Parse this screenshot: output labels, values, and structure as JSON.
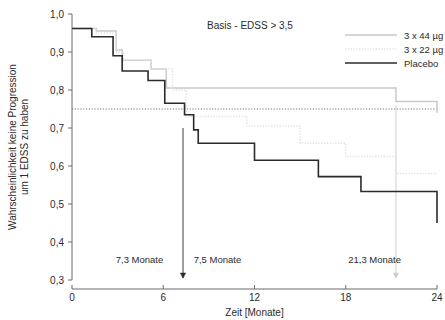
{
  "chart_data": {
    "type": "line",
    "title": "Basis - EDSS > 3,5",
    "xlabel": "Zeit [Monate]",
    "ylabel_line1": "Wahrscheinlichkeit keine Progression",
    "ylabel_line2": "um 1 EDSS zu haben",
    "xlim": [
      0,
      24
    ],
    "ylim": [
      0.3,
      1.0
    ],
    "xticks": [
      0,
      6,
      12,
      18,
      24
    ],
    "xticklabels": [
      "0",
      "6",
      "12",
      "18",
      "24"
    ],
    "yticks": [
      0.3,
      0.4,
      0.5,
      0.6,
      0.7,
      0.8,
      0.9,
      1.0
    ],
    "yticklabels": [
      "0,3",
      "0,4",
      "0,5",
      "0,6",
      "0,7",
      "0,8",
      "0,9",
      "1,0"
    ],
    "grid": false,
    "legend_position": "top-right",
    "step_style": "post",
    "reference_line": {
      "orientation": "horizontal",
      "value": 0.75,
      "style": "dotted",
      "color": "#555555"
    },
    "series": [
      {
        "name": "3 x 44 µg",
        "color": "#c9c9c9",
        "style": "solid",
        "width": 1.5,
        "x": [
          0.0,
          0.6,
          1.6,
          2.4,
          2.9,
          3.3,
          4.6,
          5.2,
          5.8,
          6.2,
          7.0,
          18.0,
          21.3,
          24.0
        ],
        "y": [
          0.962,
          0.962,
          0.955,
          0.955,
          0.905,
          0.878,
          0.878,
          0.855,
          0.855,
          0.805,
          0.805,
          0.805,
          0.77,
          0.74
        ]
      },
      {
        "name": "3 x 22 µg",
        "color": "#e2e2e2",
        "style": "dotted",
        "width": 1.5,
        "x": [
          0.0,
          0.6,
          1.6,
          2.2,
          2.9,
          3.4,
          4.6,
          5.2,
          5.9,
          6.6,
          7.5,
          9.0,
          11.5,
          13.4,
          15.0,
          16.6,
          18.0,
          19.6,
          21.3,
          24.0
        ],
        "y": [
          0.962,
          0.962,
          0.95,
          0.95,
          0.9,
          0.878,
          0.878,
          0.855,
          0.855,
          0.8,
          0.73,
          0.73,
          0.705,
          0.705,
          0.66,
          0.66,
          0.625,
          0.625,
          0.58,
          0.58
        ]
      },
      {
        "name": "Placebo",
        "color": "#2b2b2b",
        "style": "solid",
        "width": 1.6,
        "x": [
          0.0,
          0.6,
          1.3,
          2.2,
          2.7,
          3.3,
          4.2,
          5.0,
          5.7,
          6.1,
          6.9,
          7.4,
          8.0,
          8.3,
          9.2,
          11.4,
          12.0,
          15.0,
          16.2,
          18.0,
          19.0,
          21.3,
          24.0
        ],
        "y": [
          0.962,
          0.962,
          0.94,
          0.94,
          0.89,
          0.85,
          0.85,
          0.825,
          0.825,
          0.765,
          0.765,
          0.735,
          0.695,
          0.66,
          0.66,
          0.66,
          0.615,
          0.615,
          0.572,
          0.572,
          0.533,
          0.533,
          0.45
        ]
      }
    ],
    "annotations": [
      {
        "label": "7,3 Monate",
        "x": 7.3,
        "label_x": 6.0,
        "label_y": 0.345,
        "anchor": "end",
        "marker": "arrow-down",
        "marker_top": 0.7,
        "marker_bottom": 0.305,
        "color": "#2b2b2b"
      },
      {
        "label": "7,5 Monate",
        "x": 7.5,
        "label_x": 8.0,
        "label_y": 0.345,
        "anchor": "start",
        "marker": "none",
        "color": "#2b2b2b"
      },
      {
        "label": "21,3 Monate",
        "x": 21.3,
        "label_x": 19.9,
        "label_y": 0.345,
        "anchor": "middle",
        "marker": "arrow-down-light",
        "marker_top": 0.76,
        "marker_bottom": 0.305,
        "color": "#cccccc"
      }
    ]
  }
}
